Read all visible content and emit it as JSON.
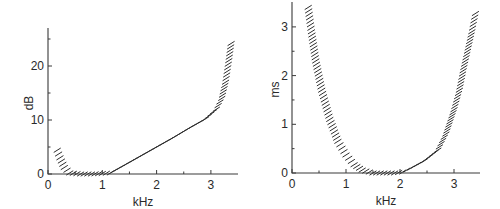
{
  "chart_data": [
    {
      "type": "line",
      "title": "",
      "xlabel": "kHz",
      "ylabel": "dB",
      "xlim": [
        0,
        3.5
      ],
      "ylim": [
        0,
        27
      ],
      "grid": false,
      "legend": null,
      "xticks": [
        0,
        1,
        2,
        3
      ],
      "xtick_labels": [
        "0",
        "1",
        "2",
        "3"
      ],
      "xminor": [
        0.5,
        1.5,
        2.5
      ],
      "yticks": [
        0,
        10,
        20
      ],
      "ytick_labels": [
        "0",
        "10",
        "20"
      ],
      "yminor": [
        5,
        15,
        25
      ],
      "style": "hatched band (short diagonal strokes along curve)",
      "series": [
        {
          "name": "threshold",
          "x": [
            0.17,
            0.22,
            0.3,
            0.4,
            0.6,
            0.8,
            1.0,
            1.15,
            1.4,
            1.7,
            2.0,
            2.3,
            2.6,
            2.9,
            3.1,
            3.2,
            3.27,
            3.33,
            3.38
          ],
          "values": [
            4.4,
            3.0,
            1.2,
            0.2,
            0.0,
            0.0,
            0.1,
            0.2,
            1.6,
            3.3,
            5.0,
            6.7,
            8.5,
            10.2,
            12.0,
            14.0,
            17.0,
            21.0,
            24.8
          ]
        }
      ]
    },
    {
      "type": "line",
      "title": "",
      "xlabel": "kHz",
      "ylabel": "ms",
      "xlim": [
        0,
        3.5
      ],
      "ylim": [
        0,
        3.5
      ],
      "grid": false,
      "legend": null,
      "xticks": [
        0,
        1,
        2,
        3
      ],
      "xtick_labels": [
        "0",
        "1",
        "2",
        "3"
      ],
      "xminor": [
        0.5,
        1.5,
        2.5
      ],
      "yticks": [
        0,
        1,
        2,
        3
      ],
      "ytick_labels": [
        "0",
        "1",
        "2",
        "3"
      ],
      "yminor": [
        0.5,
        1.5,
        2.5
      ],
      "style": "hatched band (short diagonal strokes along curve)",
      "series": [
        {
          "name": "delay",
          "x": [
            0.3,
            0.36,
            0.44,
            0.55,
            0.7,
            0.85,
            1.0,
            1.15,
            1.3,
            1.5,
            1.7,
            1.9,
            2.05,
            2.2,
            2.45,
            2.7,
            2.85,
            3.0,
            3.1,
            3.17,
            3.25,
            3.33,
            3.41
          ],
          "values": [
            3.4,
            2.9,
            2.3,
            1.7,
            1.1,
            0.65,
            0.37,
            0.17,
            0.06,
            0.0,
            0.0,
            0.0,
            0.02,
            0.1,
            0.25,
            0.47,
            0.8,
            1.3,
            1.7,
            2.1,
            2.5,
            2.9,
            3.35
          ]
        }
      ]
    }
  ]
}
